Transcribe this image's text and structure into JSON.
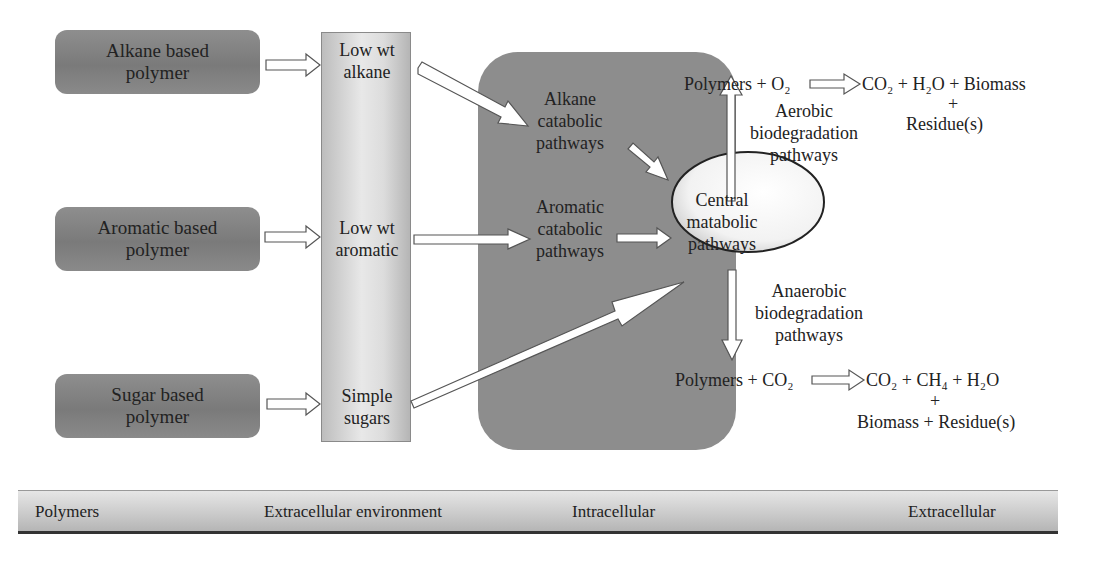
{
  "polymers": [
    {
      "line1": "Alkane based",
      "line2": "polymer"
    },
    {
      "line1": "Aromatic based",
      "line2": "polymer"
    },
    {
      "line1": "Sugar based",
      "line2": "polymer"
    }
  ],
  "extracellular_products": [
    {
      "line1": "Low wt",
      "line2": "alkane"
    },
    {
      "line1": "Low wt",
      "line2": "aromatic"
    },
    {
      "line1": "Simple",
      "line2": "sugars"
    }
  ],
  "intracellular": {
    "alkane_pathway": {
      "line1": "Alkane",
      "line2": "catabolic",
      "line3": "pathways"
    },
    "aromatic_pathway": {
      "line1": "Aromatic",
      "line2": "catabolic",
      "line3": "pathways"
    },
    "central": {
      "line1": "Central",
      "line2": "matabolic",
      "line3": "pathways"
    },
    "aerobic": {
      "line1": "Aerobic",
      "line2": "biodegradation",
      "line3": "pathways"
    },
    "anaerobic": {
      "line1": "Anaerobic",
      "line2": "biodegradation",
      "line3": "pathways"
    }
  },
  "equations": {
    "aerobic_reactants": "Polymers + O₂",
    "aerobic_products": "CO₂ + H₂O + Biomass",
    "aerobic_plus": "+",
    "aerobic_residue": "Residue(s)",
    "anaerobic_reactants": "Polymers + CO₂",
    "anaerobic_products": "CO₂ + CH₄ + H₂O",
    "anaerobic_plus": "+",
    "anaerobic_residue": "Biomass + Residue(s)"
  },
  "zones": [
    {
      "label": "Polymers"
    },
    {
      "label": "Extracellular environment"
    },
    {
      "label": "Intracellular"
    },
    {
      "label": "Extracellular"
    }
  ],
  "colors": {
    "polymer_box": "#808080",
    "cell_region": "#8d8d8d",
    "arrow_fill": "#ffffff",
    "arrow_stroke": "#555555"
  }
}
